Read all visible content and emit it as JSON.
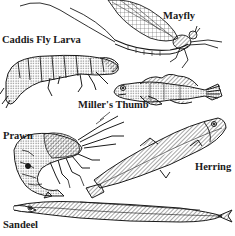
{
  "illustration": {
    "description": "Line drawing of freshwater and marine food organisms",
    "ink_color": "#1a1a1a",
    "background_color": "#ffffff",
    "labels": {
      "caddis": "Caddis Fly Larva",
      "mayfly": "Mayfly",
      "miller": "Miller's Thumb",
      "prawn": "Prawn",
      "herring": "Herring",
      "sandeel": "Sandeel"
    },
    "organisms": [
      {
        "name": "Caddis Fly Larva",
        "icon": "caddis-fly-larva-drawing"
      },
      {
        "name": "Mayfly",
        "icon": "mayfly-drawing"
      },
      {
        "name": "Miller's Thumb",
        "icon": "millers-thumb-fish-drawing"
      },
      {
        "name": "Prawn",
        "icon": "prawn-drawing"
      },
      {
        "name": "Herring",
        "icon": "herring-fish-drawing"
      },
      {
        "name": "Sandeel",
        "icon": "sandeel-fish-drawing"
      }
    ]
  }
}
